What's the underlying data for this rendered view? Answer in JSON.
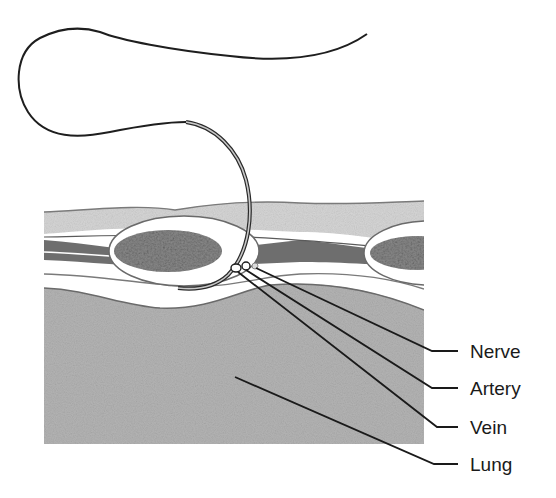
{
  "diagram": {
    "type": "anatomical-cross-section",
    "labels": [
      {
        "id": "nerve",
        "text": "Nerve"
      },
      {
        "id": "artery",
        "text": "Artery"
      },
      {
        "id": "vein",
        "text": "Vein"
      },
      {
        "id": "lung",
        "text": "Lung"
      }
    ],
    "structures": [
      "suture-thread",
      "curved-needle",
      "skin-layer",
      "muscle-layer",
      "rib-left",
      "rib-right",
      "pleura",
      "neurovascular-bundle",
      "lung-tissue"
    ],
    "colors": {
      "line": "#1a1a1a",
      "skin": "#d6d6d6",
      "muscle": "#6e6e6e",
      "rib_marrow": "#8a8a8a",
      "lung": "#b4b4b4",
      "background": "#ffffff"
    }
  }
}
